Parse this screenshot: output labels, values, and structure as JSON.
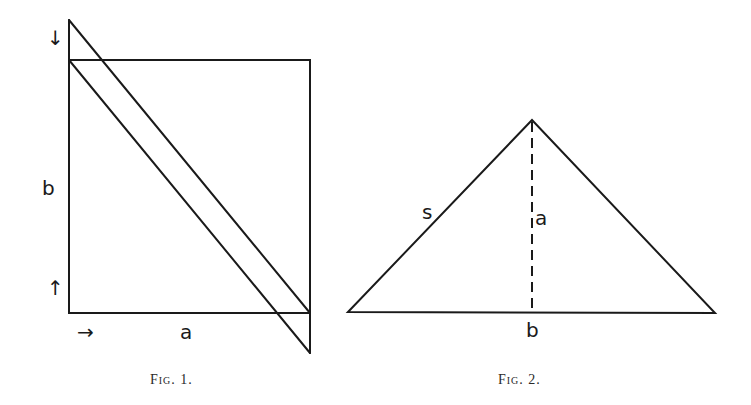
{
  "figure1": {
    "caption": "Fig. 1.",
    "labels": {
      "side_vertical": "b",
      "side_horizontal": "a"
    },
    "arrows": {
      "top": "↓",
      "bottom": "↑",
      "right": "→"
    }
  },
  "figure2": {
    "caption": "Fig. 2.",
    "labels": {
      "slant": "s",
      "altitude": "a",
      "base": "b"
    }
  },
  "colors": {
    "ink": "#1a1a1a",
    "background": "#ffffff"
  }
}
